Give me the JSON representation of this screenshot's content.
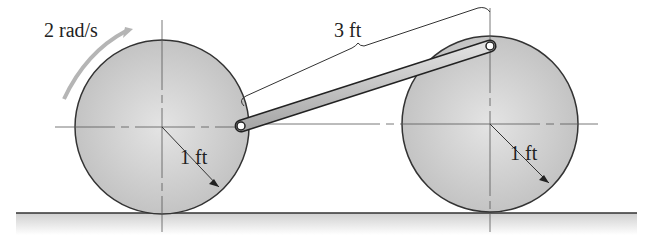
{
  "diagram": {
    "type": "mechanism",
    "angular_velocity_label": "2 rad/s",
    "link_length_label": "3 ft",
    "left_wheel_radius_label": "1 ft",
    "right_wheel_radius_label": "1 ft"
  },
  "colors": {
    "wheel_fill": "#c9c9c9",
    "wheel_outline": "#333333",
    "rod_fill": "#cfcfcf",
    "arrow_gray": "#b5b5b5",
    "ground": "#d8d8d8"
  }
}
